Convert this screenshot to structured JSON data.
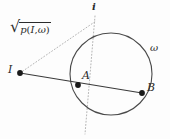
{
  "figure": {
    "kind": "geometry-diagram",
    "background_color": "#fdfdfd",
    "stroke_color": "#3a3a3a",
    "dotted_color": "#b0b0b0",
    "label_color": "#2b2b2b",
    "width": 170,
    "height": 139
  },
  "labels": {
    "point_i": "I",
    "point_a": "A",
    "point_b": "B",
    "circle_omega": "ω",
    "line_i": "i",
    "sqrt_radical": "√",
    "power_p": "p",
    "power_open_paren": "(",
    "power_arg_i": "I",
    "power_comma": ",",
    "power_arg_omega": "ω",
    "power_close_paren": ")"
  },
  "geometry": {
    "circle": {
      "cx": 111,
      "cy": 74,
      "r": 41
    },
    "points": [
      {
        "name": "I",
        "x": 20,
        "y": 73,
        "r": 2.8,
        "filled": true
      },
      {
        "name": "A",
        "x": 78,
        "y": 85,
        "r": 2.8,
        "filled": true
      },
      {
        "name": "B",
        "x": 142,
        "y": 93,
        "r": 2.8,
        "filled": true
      }
    ],
    "solid_segments": [
      {
        "name": "secant-IB",
        "x1": 20,
        "y1": 73,
        "x2": 142,
        "y2": 93
      }
    ],
    "dotted_segments": [
      {
        "name": "tangent-I-to-i",
        "x1": 20,
        "y1": 73,
        "x2": 96,
        "y2": 21
      },
      {
        "name": "line-i",
        "x1": 95,
        "y1": 16,
        "x2": 85,
        "y2": 134
      }
    ]
  },
  "label_positions": {
    "point_i": {
      "left": 8,
      "top": 64
    },
    "point_a": {
      "left": 82,
      "top": 70
    },
    "point_b": {
      "left": 147,
      "top": 82
    },
    "circle_omega": {
      "left": 150,
      "top": 43
    },
    "line_i": {
      "left": 92,
      "top": 2
    }
  }
}
